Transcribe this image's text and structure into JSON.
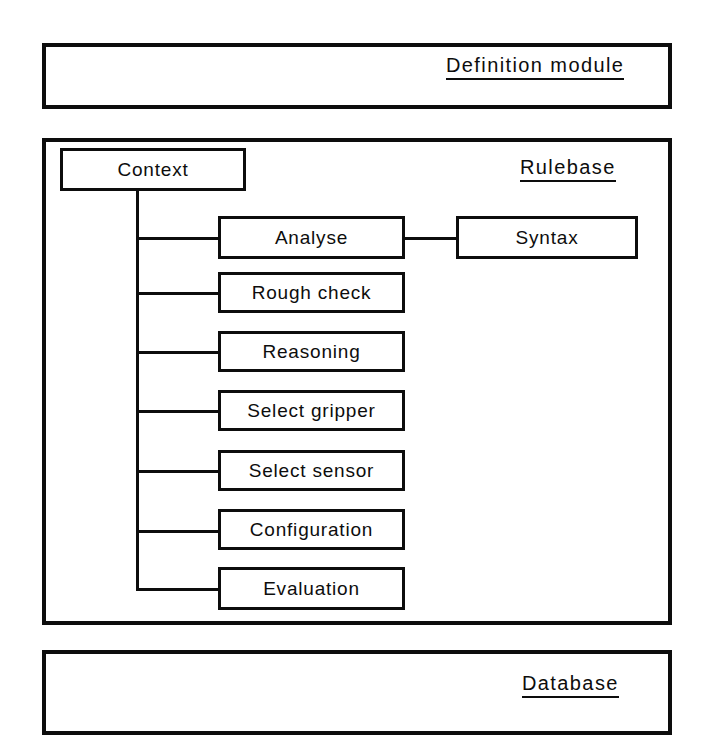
{
  "diagram": {
    "title_top": "Definition module",
    "title_bottom": "Database",
    "rulebase_label": "Rulebase",
    "context_label": "Context",
    "syntax_label": "Syntax",
    "ink_color": "#0d0d0d",
    "background_color": "#ffffff",
    "rule_nodes": [
      {
        "label": "Analyse"
      },
      {
        "label": "Rough check"
      },
      {
        "label": "Reasoning"
      },
      {
        "label": "Select gripper"
      },
      {
        "label": "Select sensor"
      },
      {
        "label": "Configuration"
      },
      {
        "label": "Evaluation"
      }
    ]
  }
}
